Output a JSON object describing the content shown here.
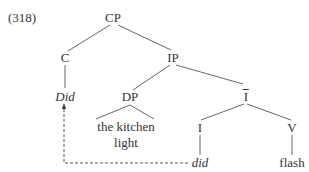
{
  "example_number": "(318)",
  "nodes": {
    "cp": "CP",
    "c": "C",
    "c_word": "Did",
    "ip": "IP",
    "dp": "DP",
    "dp_words_1": "the kitchen",
    "dp_words_2": "light",
    "ibar": "I",
    "i": "I",
    "i_word": "did",
    "v": "V",
    "v_word": "flash"
  },
  "colors": {
    "line": "#666666",
    "text": "#333333",
    "movement_arrow": "#555555"
  }
}
